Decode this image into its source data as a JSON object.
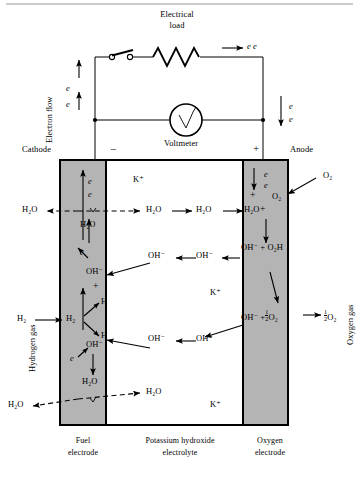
{
  "figure": {
    "type": "hydrogen-oxygen fuel cell schematic",
    "title_top": "Electrical",
    "title_top2": "load"
  },
  "circuit": {
    "electrical_load_line1": "Electrical",
    "electrical_load_line2": "load",
    "electron_flow_label": "Electron flow",
    "voltmeter_label": "Voltmeter",
    "top_electrons": "e e",
    "left_e_upper": "e",
    "left_e_lower": "e",
    "right_e_upper": "e",
    "right_e_lower": "e",
    "cathode_label": "Cathode",
    "anode_label": "Anode",
    "minus_sign": "−",
    "plus_sign": "+"
  },
  "cell": {
    "fuel_electrode_caption_l1": "Fuel",
    "fuel_electrode_caption_l2": "electrode",
    "electrolyte_caption_l1": "Potassium hydroxide",
    "electrolyte_caption_l2": "electrolyte",
    "oxygen_electrode_caption_l1": "Oxygen",
    "oxygen_electrode_caption_l2": "electrode",
    "hydrogen_gas_label": "Hydrogen gas",
    "oxygen_gas_label": "Oxygen gas",
    "electrode_fill": "#b4b4b4"
  },
  "species": {
    "water": "H₂O",
    "hydroxide": "OH⁻",
    "hydrogen_molecule": "H₂",
    "hydrogen_atom": "H",
    "oxygen_molecule": "O₂",
    "potassium_ion": "K⁺",
    "electron": "e",
    "perhydroxyl": "O₂H",
    "half_oxygen": "½O₂"
  },
  "cathode_side": {
    "electrons_top": [
      "e",
      "e"
    ],
    "water_in_electrode": "H₂O",
    "water_out_left": "H₂O",
    "electron_mid": "e",
    "hydroxide_mid": "OH⁻",
    "plus_mid": "+",
    "hydrogen_atom_upper": "H",
    "hydrogen_molecule_in": "H₂",
    "hydrogen_molecule_label": "H₂",
    "hydrogen_atom_lower": "H",
    "electron_lower": "e",
    "hydroxide_lower": "OH⁻",
    "water_lower": "H₂O",
    "water_out_bottom_left": "H₂O"
  },
  "electrolyte_region": {
    "potassium_top": "K⁺",
    "potassium_mid": "K⁺",
    "potassium_bottom": "K⁺",
    "water_chain": [
      "H₂O",
      "H₂O"
    ],
    "hydroxide_chain": [
      "OH⁻",
      "OH⁻"
    ],
    "water_bottom": "H₂O"
  },
  "anode_side": {
    "electrons_top": [
      "e",
      "e"
    ],
    "plus_left": "+",
    "plus_right": "+",
    "oxygen_in_electrode": "O₂",
    "oxygen_gas_in": "O₂",
    "water_in": "H₂O",
    "reaction_upper": "OH⁻ + O₂H",
    "reaction_lower_left": "OH⁻ +",
    "reaction_lower_frac": "½",
    "reaction_lower_species": "O₂",
    "product_frac": "½",
    "product_species": "O₂"
  }
}
